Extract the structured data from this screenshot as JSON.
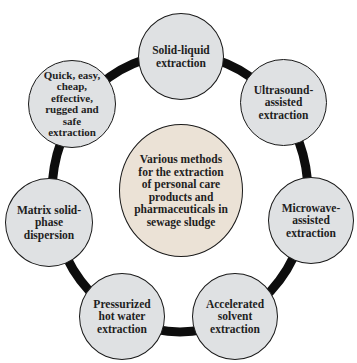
{
  "diagram": {
    "type": "hub-and-ring",
    "colors": {
      "ring": "#0d0d0d",
      "node_fill": "#dfe1e3",
      "hub_fill": "#ebe2d6",
      "border": "#1a1a1a",
      "text": "#1e1e1e"
    },
    "hub": {
      "label": "Various methods\nfor the extraction\nof personal care\nproducts and\npharmaceuticals in\nsewage sludge"
    },
    "nodes": [
      {
        "id": "solid-liquid",
        "label": "Solid-liquid\nextraction"
      },
      {
        "id": "ultrasound",
        "label": "Ultrasound-\nassisted\nextraction"
      },
      {
        "id": "microwave",
        "label": "Microwave-\nassisted\nextraction"
      },
      {
        "id": "accelerated-solvent",
        "label": "Accelerated\nsolvent\nextraction"
      },
      {
        "id": "pressurized-hot-water",
        "label": "Pressurized\nhot water\nextraction"
      },
      {
        "id": "matrix-solid-phase",
        "label": "Matrix solid-\nphase\ndispersion"
      },
      {
        "id": "quechers",
        "label": "Quick, easy,\ncheap,\neffective,\nrugged and\nsafe\nextraction"
      }
    ]
  }
}
